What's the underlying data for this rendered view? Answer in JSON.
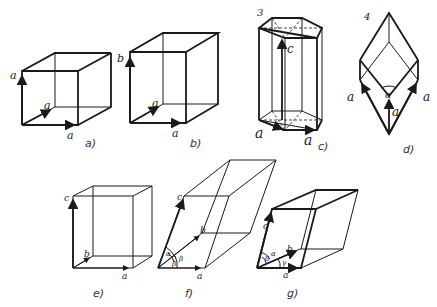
{
  "figure": {
    "panels": [
      {
        "id": "a",
        "caption": "a)",
        "name": "cubic",
        "axis_labels": [
          "a",
          "a",
          "a"
        ]
      },
      {
        "id": "b",
        "caption": "b)",
        "name": "tetragonal",
        "axis_labels": [
          "b",
          "a",
          "a"
        ]
      },
      {
        "id": "c",
        "caption": "c)",
        "name": "hexagonal",
        "number": "3",
        "axis_labels": [
          "c",
          "a",
          "a"
        ]
      },
      {
        "id": "d",
        "caption": "d)",
        "name": "rhombohedral",
        "number": "4",
        "axis_labels": [
          "a",
          "a",
          "a"
        ],
        "angle_label": "α"
      },
      {
        "id": "e",
        "caption": "e)",
        "name": "orthorhombic",
        "axis_labels": [
          "c",
          "b",
          "a"
        ]
      },
      {
        "id": "f",
        "caption": "f)",
        "name": "monoclinic",
        "axis_labels": [
          "c",
          "b",
          "a"
        ],
        "angle_labels": [
          "α",
          "β",
          "β"
        ]
      },
      {
        "id": "g",
        "caption": "g)",
        "name": "triclinic",
        "axis_labels": [
          "c",
          "b",
          "a"
        ],
        "angle_labels": [
          "α",
          "β",
          "γ"
        ]
      }
    ]
  }
}
